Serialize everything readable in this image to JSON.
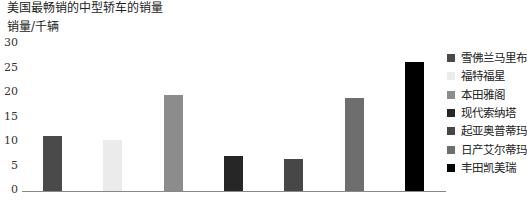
{
  "chart_data": {
    "type": "bar",
    "title": "美国最畅销的中型轿车的销量",
    "xlabel": "",
    "ylabel": "销量/千辆",
    "ylim": [
      0,
      30
    ],
    "yticks": [
      0,
      5,
      10,
      15,
      20,
      25,
      30
    ],
    "grid": false,
    "legend_position": "right",
    "categories": [
      "雪佛兰马里布",
      "福特福星",
      "本田雅阁",
      "现代索纳塔",
      "起亚奥普蒂玛",
      "日产艾尔蒂玛",
      "丰田凯美瑞"
    ],
    "values": [
      11.2,
      10.4,
      19.6,
      7.1,
      6.5,
      19.0,
      26.3
    ],
    "colors": [
      "#4a4a4a",
      "#ebebeb",
      "#8c8c8c",
      "#262626",
      "#474747",
      "#6e6e6e",
      "#000000"
    ]
  },
  "ticks": [
    "0",
    "5",
    "10",
    "15",
    "20",
    "25",
    "30"
  ]
}
